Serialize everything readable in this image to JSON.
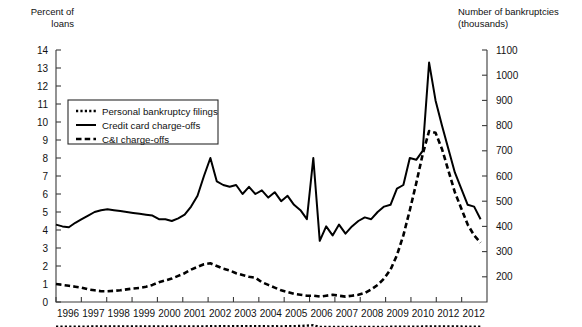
{
  "chart_data": {
    "type": "line",
    "title": "",
    "xlabel": "",
    "ylabel": "Percent of loans",
    "y2label": "Number of bankruptcies (thousands)",
    "grid": false,
    "legend_position": "upper-left-inside",
    "left_axis": {
      "label_line1": "Percent of",
      "label_line2": "loans",
      "ticks": [
        0,
        1,
        2,
        3,
        4,
        5,
        6,
        7,
        8,
        9,
        10,
        11,
        12,
        13,
        14
      ],
      "ylim": [
        0,
        14
      ]
    },
    "right_axis": {
      "label_line1": "Number of bankruptcies",
      "label_line2": "(thousands)",
      "ticks": [
        200,
        300,
        400,
        500,
        600,
        700,
        800,
        900,
        1000,
        1100
      ],
      "ylim": [
        100,
        1100
      ]
    },
    "x_tick_labels": [
      "1996",
      "1997",
      "1998",
      "1999",
      "2000",
      "2001",
      "2002",
      "2003",
      "2004",
      "2005",
      "2006",
      "2007",
      "2008",
      "2009",
      "2010",
      "2012",
      "2012"
    ],
    "xlim": [
      1996,
      2012.75
    ],
    "series": [
      {
        "name": "Personal bankruptcy filings",
        "axis": "right",
        "style": "dotted",
        "legend_label": "Personal bankruptcy filings",
        "x": [
          1996,
          1996.25,
          1996.5,
          1996.75,
          1997,
          1997.25,
          1997.5,
          1997.75,
          1998,
          1998.25,
          1998.5,
          1998.75,
          1999,
          1999.25,
          1999.5,
          1999.75,
          2000,
          2000.25,
          2000.5,
          2000.75,
          2001,
          2001.25,
          2001.5,
          2001.75,
          2002,
          2002.25,
          2002.5,
          2002.75,
          2003,
          2003.25,
          2003.5,
          2003.75,
          2004,
          2004.25,
          2004.5,
          2004.75,
          2005,
          2005.25,
          2005.5,
          2005.75,
          2006,
          2006.25,
          2006.5,
          2006.75,
          2007,
          2007.25,
          2007.5,
          2007.75,
          2008,
          2008.25,
          2008.5,
          2008.75,
          2009,
          2009.25,
          2009.5,
          2009.75,
          2010,
          2010.25,
          2010.5,
          2010.75,
          2011,
          2011.25,
          2011.5,
          2011.75,
          2012,
          2012.25,
          2012.5
        ],
        "values": [
          1.75,
          1.85,
          2.0,
          2.15,
          2.3,
          2.45,
          2.6,
          2.75,
          2.95,
          3.1,
          3.2,
          3.2,
          3.15,
          3.15,
          3.1,
          3.2,
          3.1,
          3.15,
          3.0,
          3.05,
          3.2,
          3.35,
          3.25,
          3.3,
          3.6,
          3.45,
          3.6,
          3.45,
          3.6,
          3.5,
          3.6,
          3.5,
          3.6,
          3.45,
          3.5,
          3.4,
          3.55,
          4.1,
          5.0,
          6.3,
          8.0,
          0.7,
          0.65,
          0.7,
          0.75,
          0.8,
          0.85,
          0.9,
          0.95,
          1.05,
          1.15,
          1.3,
          1.5,
          1.8,
          2.05,
          2.25,
          2.4,
          2.5,
          2.6,
          2.7,
          2.75,
          2.7,
          2.6,
          2.5,
          2.4,
          2.3,
          2.2
        ]
      },
      {
        "name": "Credit card charge-offs",
        "axis": "left",
        "style": "solid",
        "legend_label": "Credit card charge-offs",
        "x": [
          1996,
          1996.25,
          1996.5,
          1996.75,
          1997,
          1997.25,
          1997.5,
          1997.75,
          1998,
          1998.25,
          1998.5,
          1998.75,
          1999,
          1999.25,
          1999.5,
          1999.75,
          2000,
          2000.25,
          2000.5,
          2000.75,
          2001,
          2001.25,
          2001.5,
          2001.75,
          2002,
          2002.25,
          2002.5,
          2002.75,
          2003,
          2003.25,
          2003.5,
          2003.75,
          2004,
          2004.25,
          2004.5,
          2004.75,
          2005,
          2005.25,
          2005.5,
          2005.75,
          2006,
          2006.25,
          2006.5,
          2006.75,
          2007,
          2007.25,
          2007.5,
          2007.75,
          2008,
          2008.25,
          2008.5,
          2008.75,
          2009,
          2009.25,
          2009.5,
          2009.75,
          2010,
          2010.25,
          2010.5,
          2010.75,
          2011,
          2011.25,
          2011.5,
          2011.75,
          2012,
          2012.25,
          2012.5
        ],
        "values": [
          4.3,
          4.2,
          4.15,
          4.4,
          4.6,
          4.8,
          5.0,
          5.1,
          5.15,
          5.1,
          5.05,
          5.0,
          4.95,
          4.9,
          4.85,
          4.8,
          4.6,
          4.6,
          4.5,
          4.65,
          4.85,
          5.3,
          5.9,
          7.0,
          8.0,
          6.7,
          6.5,
          6.4,
          6.5,
          6.0,
          6.4,
          6.0,
          6.2,
          5.8,
          6.1,
          5.6,
          5.9,
          5.4,
          5.1,
          4.6,
          8.0,
          3.4,
          4.2,
          3.7,
          4.3,
          3.8,
          4.2,
          4.5,
          4.7,
          4.6,
          5.0,
          5.3,
          5.4,
          6.3,
          6.5,
          8.0,
          7.9,
          8.4,
          13.3,
          11.2,
          9.8,
          8.5,
          7.2,
          6.3,
          5.4,
          5.3,
          4.6
        ]
      },
      {
        "name": "C&I charge-offs",
        "axis": "left",
        "style": "dashed",
        "legend_label": "C&I charge-offs",
        "x": [
          1996,
          1996.25,
          1996.5,
          1996.75,
          1997,
          1997.25,
          1997.5,
          1997.75,
          1998,
          1998.25,
          1998.5,
          1998.75,
          1999,
          1999.25,
          1999.5,
          1999.75,
          2000,
          2000.25,
          2000.5,
          2000.75,
          2001,
          2001.25,
          2001.5,
          2001.75,
          2002,
          2002.25,
          2002.5,
          2002.75,
          2003,
          2003.25,
          2003.5,
          2003.75,
          2004,
          2004.25,
          2004.5,
          2004.75,
          2005,
          2005.25,
          2005.5,
          2005.75,
          2006,
          2006.25,
          2006.5,
          2006.75,
          2007,
          2007.25,
          2007.5,
          2007.75,
          2008,
          2008.25,
          2008.5,
          2008.75,
          2009,
          2009.25,
          2009.5,
          2009.75,
          2010,
          2010.25,
          2010.5,
          2010.75,
          2011,
          2011.25,
          2011.5,
          2011.75,
          2012,
          2012.25,
          2012.5
        ],
        "values": [
          1.0,
          0.95,
          0.9,
          0.85,
          0.8,
          0.7,
          0.65,
          0.6,
          0.6,
          0.62,
          0.65,
          0.7,
          0.75,
          0.78,
          0.85,
          0.95,
          1.1,
          1.2,
          1.3,
          1.45,
          1.6,
          1.8,
          1.95,
          2.1,
          2.15,
          2.0,
          1.85,
          1.75,
          1.6,
          1.5,
          1.4,
          1.35,
          1.1,
          0.95,
          0.8,
          0.65,
          0.55,
          0.45,
          0.4,
          0.35,
          0.35,
          0.3,
          0.35,
          0.4,
          0.35,
          0.3,
          0.35,
          0.4,
          0.5,
          0.7,
          0.95,
          1.3,
          1.8,
          2.6,
          3.7,
          5.1,
          6.6,
          8.2,
          9.5,
          9.4,
          8.5,
          7.3,
          6.1,
          5.2,
          4.3,
          3.7,
          3.3
        ]
      }
    ]
  }
}
